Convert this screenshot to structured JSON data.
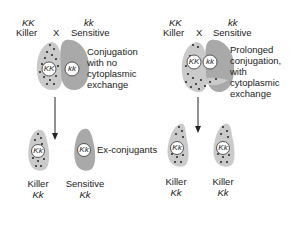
{
  "left_panel": {
    "parent1": {
      "genotype": "KK",
      "phenotype": "Killer"
    },
    "cross_symbol": "X",
    "parent2": {
      "genotype": "kk",
      "phenotype": "Sensitive"
    },
    "process_label": [
      "Conjugation",
      "with no",
      "cytoplasmic",
      "exchange"
    ],
    "nuclei": [
      "KK",
      "kk"
    ],
    "ex_conjugant_label": "Ex-conjugants",
    "progeny": [
      {
        "phenotype": "Killer",
        "genotype": "Kk",
        "nucleus": "Kk"
      },
      {
        "phenotype": "Sensitive",
        "genotype": "Kk",
        "nucleus": "Kk"
      }
    ]
  },
  "right_panel": {
    "parent1": {
      "genotype": "KK",
      "phenotype": "Killer"
    },
    "cross_symbol": "X",
    "parent2": {
      "genotype": "kk",
      "phenotype": "Sensitive"
    },
    "process_label": [
      "Prolonged",
      "conjugation,",
      "with",
      "cytoplasmic",
      "exchange"
    ],
    "nuclei": [
      "KK",
      "kk"
    ],
    "progeny": [
      {
        "phenotype": "Killer",
        "genotype": "Kk",
        "nucleus": "Kk"
      },
      {
        "phenotype": "Killer",
        "genotype": "Kk",
        "nucleus": "Kk"
      }
    ]
  },
  "colors": {
    "killer_cell": "#c8c8c8",
    "sensitive_cell": "#a8a8a8",
    "particle": "#222222"
  }
}
